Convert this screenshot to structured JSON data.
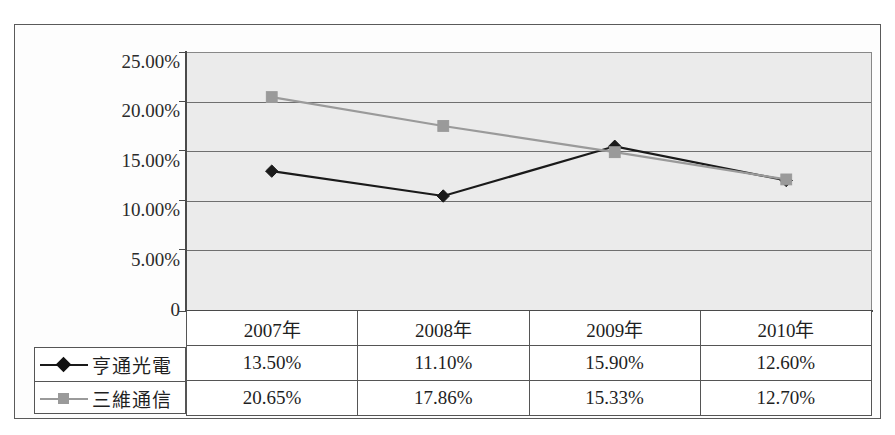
{
  "chart_data": {
    "type": "line",
    "title": "",
    "xlabel": "",
    "ylabel": "",
    "categories": [
      "2007年",
      "2008年",
      "2009年",
      "2010年"
    ],
    "series": [
      {
        "name": "亨通光電",
        "color": "#1a1a1a",
        "marker": "diamond",
        "values": [
          13.5,
          11.1,
          15.9,
          12.6
        ],
        "labels": [
          "13.50%",
          "11.10%",
          "15.90%",
          "12.60%"
        ]
      },
      {
        "name": "三維通信",
        "color": "#9a9a9a",
        "marker": "square",
        "values": [
          20.65,
          17.86,
          15.33,
          12.7
        ],
        "labels": [
          "20.65%",
          "17.86%",
          "15.33%",
          "12.70%"
        ]
      }
    ],
    "ylim": [
      0,
      25
    ],
    "ytick_values": [
      25,
      20,
      15,
      10,
      5,
      0
    ],
    "ytick_labels": [
      "25.00%",
      "20.00%",
      "15.00%",
      "10.00%",
      "5.00%",
      "0"
    ],
    "grid": true,
    "legend_position": "bottom-left-table",
    "has_data_table": true
  },
  "axis": {
    "y_labels": [
      {
        "text": "25.00%",
        "value": 25
      },
      {
        "text": "20.00%",
        "value": 20
      },
      {
        "text": "15.00%",
        "value": 15
      },
      {
        "text": "10.00%",
        "value": 10
      },
      {
        "text": "5.00%",
        "value": 5
      },
      {
        "text": "0",
        "value": 0
      }
    ]
  },
  "table": {
    "header": [
      "",
      "2007年",
      "2008年",
      "2009年",
      "2010年"
    ],
    "rows": [
      {
        "legend": "亨通光電",
        "marker": "diamond",
        "color": "#1a1a1a",
        "cells": [
          "13.50%",
          "11.10%",
          "15.90%",
          "12.60%"
        ]
      },
      {
        "legend": "三維通信",
        "marker": "square",
        "color": "#9a9a9a",
        "cells": [
          "20.65%",
          "17.86%",
          "15.33%",
          "12.70%"
        ]
      }
    ]
  },
  "style": {
    "plot_background": "#ebebeb",
    "gridline_color": "#6f6f6f",
    "axis_color": "#4a4a4a",
    "series1_color": "#1a1a1a",
    "series2_color": "#9a9a9a",
    "frame_color": "#5a5a5a"
  }
}
